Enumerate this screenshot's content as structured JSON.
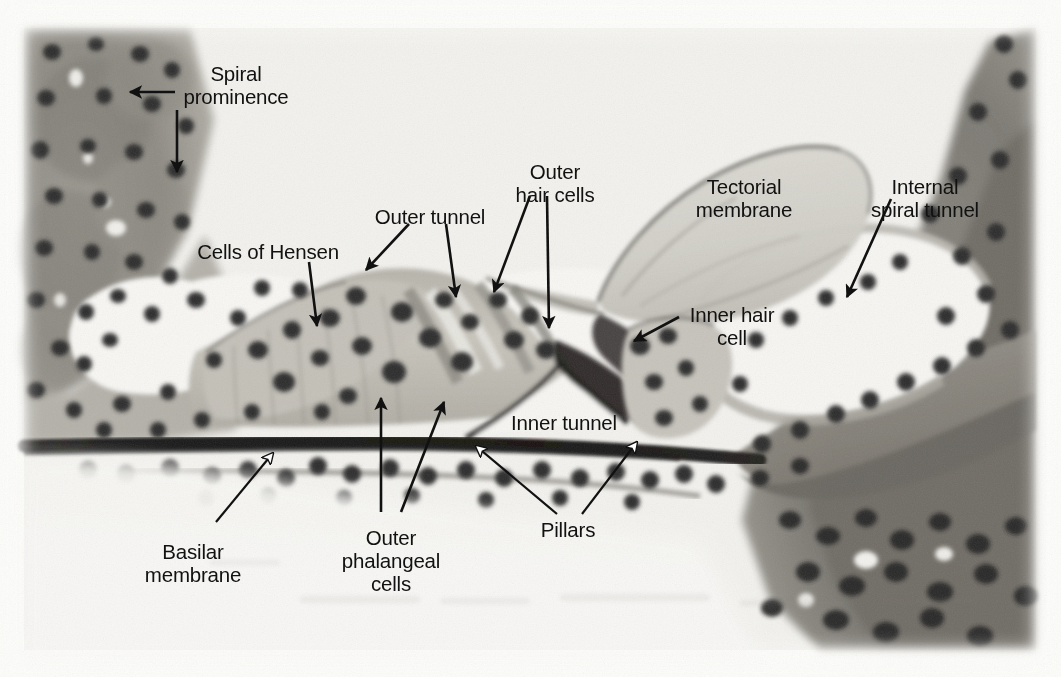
{
  "figure": {
    "kind": "histological-micrograph",
    "width": 1061,
    "height": 677,
    "page_background": "#fdfdfb",
    "stain_colors": {
      "nuclei": "#2c2a2c",
      "cytoplasm_light": "#cfccc4",
      "cytoplasm_mid": "#a8a49a",
      "connective_dark": "#6e6a62",
      "lumen_white": "#fbfaf7",
      "basilar_membrane": "#161514"
    }
  },
  "labels": [
    {
      "id": "spiral-prominence",
      "text": "Spiral\nprominence",
      "x": 236,
      "y": 62,
      "align": "center"
    },
    {
      "id": "cells-of-hensen",
      "text": "Cells of Hensen",
      "x": 268,
      "y": 240,
      "align": "center"
    },
    {
      "id": "outer-tunnel",
      "text": "Outer tunnel",
      "x": 430,
      "y": 205,
      "align": "center"
    },
    {
      "id": "outer-hair-cells",
      "text": "Outer\nhair cells",
      "x": 555,
      "y": 160,
      "align": "center"
    },
    {
      "id": "tectorial-membrane",
      "text": "Tectorial\nmembrane",
      "x": 744,
      "y": 175,
      "align": "center"
    },
    {
      "id": "internal-spiral-tunnel",
      "text": "Internal\nspiral tunnel",
      "x": 925,
      "y": 175,
      "align": "center"
    },
    {
      "id": "inner-hair-cell",
      "text": "Inner hair\ncell",
      "x": 732,
      "y": 313,
      "align": "center"
    },
    {
      "id": "inner-tunnel",
      "text": "Inner tunnel",
      "x": 564,
      "y": 422,
      "align": "center"
    },
    {
      "id": "pillars",
      "text": "Pillars",
      "x": 568,
      "y": 531,
      "align": "center"
    },
    {
      "id": "outer-phalangeal-cells",
      "text": "Outer\nphalangeal\ncells",
      "x": 390,
      "y": 545,
      "align": "center"
    },
    {
      "id": "basilar-membrane",
      "text": "Basilar\nmembrane",
      "x": 193,
      "y": 545,
      "align": "center"
    }
  ],
  "leaders": [
    {
      "id": "leader-spiral-prominence-horizontal",
      "style": "black-arrow",
      "from": [
        175,
        92
      ],
      "to": [
        127,
        92
      ]
    },
    {
      "id": "leader-spiral-prominence-vertical",
      "style": "black-arrow",
      "from": [
        177,
        108
      ],
      "to": [
        177,
        175
      ]
    },
    {
      "id": "leader-cells-of-hensen",
      "style": "black-arrow",
      "from": [
        309,
        262
      ],
      "to": [
        318,
        330
      ]
    },
    {
      "id": "leader-outer-tunnel",
      "style": "black-arrow",
      "from": [
        408,
        225
      ],
      "to": [
        363,
        272
      ]
    },
    {
      "id": "leader-outer-tunnel-2",
      "style": "black-arrow",
      "from": [
        444,
        225
      ],
      "to": [
        455,
        300
      ]
    },
    {
      "id": "leader-outer-hair-cells-left",
      "style": "black-arrow",
      "from": [
        528,
        197
      ],
      "to": [
        492,
        296
      ]
    },
    {
      "id": "leader-outer-hair-cells-right",
      "style": "black-arrow",
      "from": [
        545,
        197
      ],
      "to": [
        547,
        332
      ]
    },
    {
      "id": "leader-internal-spiral-tunnel",
      "style": "black-arrow",
      "from": [
        890,
        200
      ],
      "to": [
        845,
        300
      ]
    },
    {
      "id": "leader-inner-hair-cell",
      "style": "black-arrow",
      "from": [
        678,
        318
      ],
      "to": [
        632,
        342
      ]
    },
    {
      "id": "leader-outer-phalangeal-left",
      "style": "black-arrow",
      "from": [
        381,
        510
      ],
      "to": [
        381,
        400
      ]
    },
    {
      "id": "leader-outer-phalangeal-right",
      "style": "black-arrow",
      "from": [
        400,
        510
      ],
      "to": [
        442,
        405
      ]
    },
    {
      "id": "leader-pillars-left",
      "style": "white-arrow",
      "from": [
        556,
        512
      ],
      "to": [
        472,
        444
      ]
    },
    {
      "id": "leader-pillars-right",
      "style": "white-arrow",
      "from": [
        581,
        512
      ],
      "to": [
        640,
        440
      ]
    },
    {
      "id": "leader-basilar-membrane",
      "style": "white-arrow",
      "from": [
        215,
        520
      ],
      "to": [
        276,
        451
      ]
    }
  ]
}
